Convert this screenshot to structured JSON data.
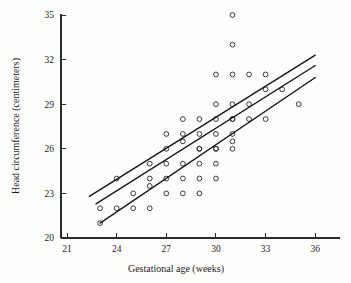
{
  "chart_data": {
    "type": "scatter",
    "title": "",
    "xlabel": "Gestational age (weeks)",
    "ylabel": "Head circumference (centimeters)",
    "xlim": [
      20.2,
      37.2
    ],
    "ylim": [
      19.4,
      35.6
    ],
    "xticks": [
      21,
      24,
      27,
      30,
      33,
      36
    ],
    "yticks": [
      20,
      23,
      26,
      29,
      32,
      35
    ],
    "xtick_labels": [
      "21",
      "24",
      "27",
      "30",
      "33",
      "36"
    ],
    "ytick_labels": [
      "20",
      "23",
      "26",
      "29",
      "32",
      "35"
    ],
    "grid": false,
    "legend": null,
    "marker": "open-circle",
    "x": [
      23.0,
      23.0,
      24.0,
      24.0,
      25.0,
      25.0,
      26.0,
      26.0,
      26.0,
      27.0,
      27.0,
      27.0,
      27.0,
      28.0,
      28.0,
      28.0,
      28.0,
      28.0,
      29.0,
      29.0,
      29.0,
      29.0,
      29.0,
      29.0,
      30.0,
      30.0,
      30.0,
      30.0,
      30.0,
      30.0,
      30.0,
      31.0,
      31.0,
      31.0,
      31.0,
      31.0,
      31.0,
      31.0,
      31.0,
      32.0,
      32.0,
      33.0,
      33.0,
      33.0,
      34.0,
      35.0,
      29.0,
      28.0,
      30.0,
      31.0,
      32.0,
      27.0,
      26.0
    ],
    "y": [
      21.0,
      22.0,
      22.0,
      24.0,
      22.0,
      23.0,
      23.5,
      25.0,
      22.0,
      23.0,
      24.0,
      26.0,
      27.0,
      23.0,
      24.0,
      25.0,
      26.5,
      27.0,
      23.0,
      24.0,
      25.0,
      26.0,
      27.0,
      28.0,
      24.0,
      25.0,
      26.0,
      27.0,
      28.0,
      29.0,
      31.0,
      26.0,
      27.0,
      28.0,
      29.0,
      31.0,
      33.0,
      35.0,
      28.0,
      31.0,
      29.0,
      30.0,
      31.0,
      28.0,
      30.0,
      29.0,
      26.0,
      28.0,
      26.0,
      26.5,
      28.0,
      25.0,
      24.0
    ],
    "fit_lines": [
      {
        "name": "upper-band",
        "x1": 22.35,
        "y1": 22.8,
        "x2": 36.0,
        "y2": 32.3
      },
      {
        "name": "regression-line",
        "x1": 22.75,
        "y1": 22.3,
        "x2": 36.0,
        "y2": 31.6
      },
      {
        "name": "lower-band",
        "x1": 23.0,
        "y1": 21.0,
        "x2": 36.0,
        "y2": 30.8
      }
    ]
  },
  "axes": {
    "x_title": "Gestational age (weeks)",
    "y_title": "Head circumference (centimeters)"
  }
}
